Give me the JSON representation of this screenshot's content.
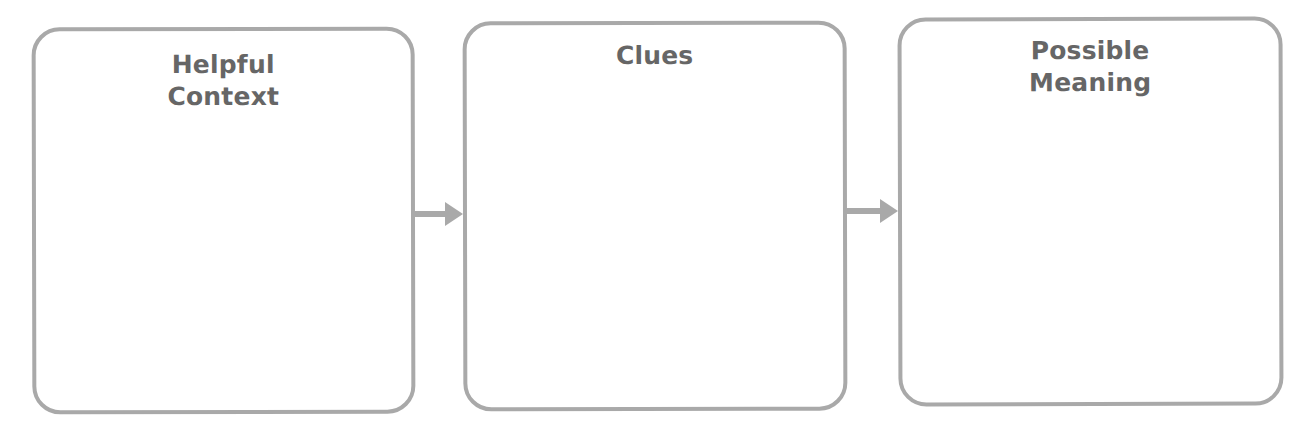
{
  "organizer": {
    "type": "three-box flow chart",
    "colors": {
      "border": "#a9a9a9",
      "arrow": "#a9a9a9",
      "title_text": "#666666",
      "background": "#ffffff"
    },
    "boxes": [
      {
        "id": "box-1",
        "title_lines": [
          "Helpful",
          "Context"
        ],
        "content": ""
      },
      {
        "id": "box-2",
        "title_lines": [
          "Clues"
        ],
        "content": ""
      },
      {
        "id": "box-3",
        "title_lines": [
          "Possible",
          "Meaning"
        ],
        "content": ""
      }
    ],
    "arrows": [
      {
        "from": "box-1",
        "to": "box-2",
        "icon": "arrow-right-icon"
      },
      {
        "from": "box-2",
        "to": "box-3",
        "icon": "arrow-right-icon"
      }
    ]
  }
}
